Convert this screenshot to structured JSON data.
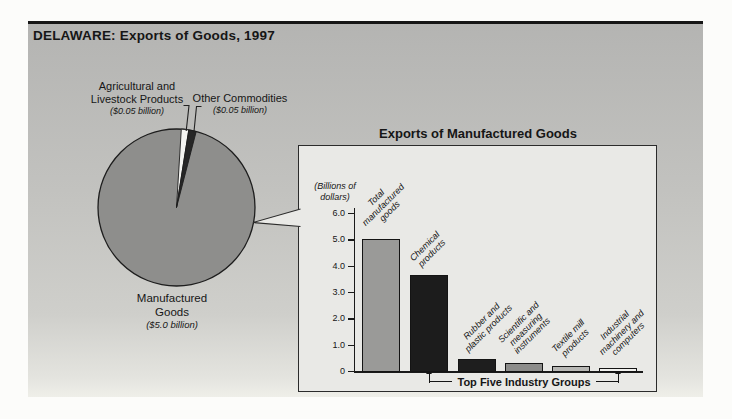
{
  "header": {
    "title": "DELAWARE: Exports of Goods, 1997"
  },
  "pie": {
    "labels": {
      "agricultural": {
        "line1": "Agricultural and",
        "line2": "Livestock Products",
        "value": "($0.05 billion)"
      },
      "other": {
        "line1": "Other Commodities",
        "value": "($0.05 billion)"
      },
      "manufactured": {
        "line1": "Manufactured",
        "line2": "Goods",
        "value": "($5.0 billion)"
      }
    },
    "colors": {
      "manufactured": "#8e8e8c",
      "agricultural": "#f4f4f1",
      "other": "#262626",
      "outline": "#1d1d1d"
    }
  },
  "bar_chart": {
    "title": "Exports of Manufactured Goods",
    "y_axis_label_line1": "(Billions of",
    "y_axis_label_line2": "dollars)",
    "y_ticks": [
      "6.0",
      "5.0",
      "4.0",
      "3.0",
      "2.0",
      "1.0",
      "0"
    ],
    "bars": [
      {
        "label_lines": [
          "Total",
          "manufactured",
          "goods"
        ],
        "value": 5.0,
        "color": "#9a9a98"
      },
      {
        "label_lines": [
          "Chemical",
          "products"
        ],
        "value": 3.65,
        "color": "#1c1c1c"
      },
      {
        "label_lines": [
          "Rubber and",
          "plastic products"
        ],
        "value": 0.45,
        "color": "#1e1e1e"
      },
      {
        "label_lines": [
          "Scientific and",
          "measuring",
          "instruments"
        ],
        "value": 0.3,
        "color": "#8c8c8a"
      },
      {
        "label_lines": [
          "Textile mill",
          "products"
        ],
        "value": 0.2,
        "color": "#b7b7b4"
      },
      {
        "label_lines": [
          "Industrial",
          "machinery and",
          "computers"
        ],
        "value": 0.1,
        "color": "#f2f2ef"
      }
    ],
    "footer_label": "Top Five Industry Groups"
  },
  "chart_data": [
    {
      "type": "pie",
      "title": "DELAWARE: Exports of Goods, 1997",
      "units": "billions of dollars",
      "slices": [
        {
          "label": "Manufactured Goods",
          "value": 5.0
        },
        {
          "label": "Agricultural and Livestock Products",
          "value": 0.05
        },
        {
          "label": "Other Commodities",
          "value": 0.05
        }
      ]
    },
    {
      "type": "bar",
      "title": "Exports of Manufactured Goods",
      "ylabel": "(Billions of dollars)",
      "ylim": [
        0,
        6.0
      ],
      "categories": [
        "Total manufactured goods",
        "Chemical products",
        "Rubber and plastic products",
        "Scientific and measuring instruments",
        "Textile mill products",
        "Industrial machinery and computers"
      ],
      "values": [
        5.0,
        3.65,
        0.45,
        0.3,
        0.2,
        0.1
      ],
      "annotation": "Top Five Industry Groups"
    }
  ]
}
